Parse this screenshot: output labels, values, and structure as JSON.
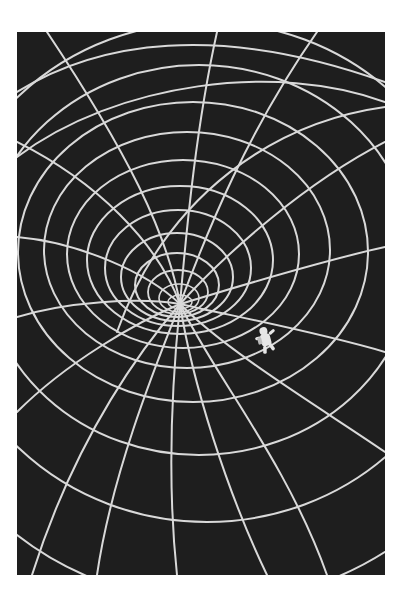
{
  "artwork": {
    "subject": "spacetime grid gravity well with astronaut",
    "colors": {
      "page_background": "#ffffff",
      "canvas_background": "#1e1e1e",
      "grid_line": "#d9d9d9"
    },
    "elements": [
      "gravity-well-grid",
      "astronaut-figure"
    ]
  }
}
